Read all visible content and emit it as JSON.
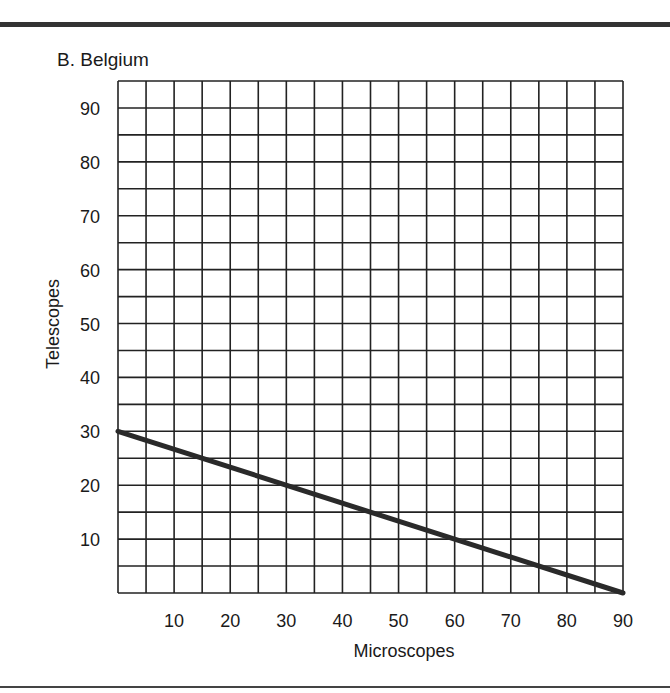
{
  "chart_data": {
    "type": "line",
    "title": "B. Belgium",
    "xlabel": "Microscopes",
    "ylabel": "Telescopes",
    "xlim": [
      0,
      90
    ],
    "ylim": [
      0,
      95
    ],
    "x_ticks": [
      10,
      20,
      30,
      40,
      50,
      60,
      70,
      80,
      90
    ],
    "y_ticks": [
      10,
      20,
      30,
      40,
      50,
      60,
      70,
      80,
      90
    ],
    "grid": true,
    "grid_step_x": 5,
    "grid_step_y": 5,
    "series": [
      {
        "name": "Production possibilities frontier",
        "x": [
          0,
          90
        ],
        "y": [
          30,
          0
        ]
      }
    ]
  }
}
